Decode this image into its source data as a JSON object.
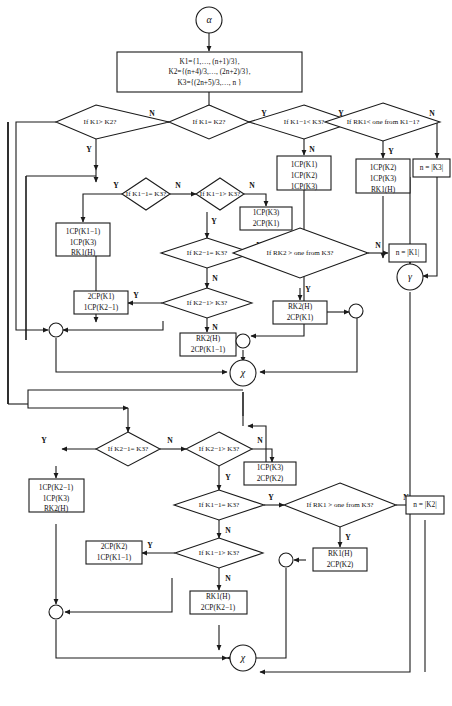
{
  "diagram": {
    "type": "flowchart",
    "title": "",
    "start_symbol": "α",
    "connector_symbols": {
      "gamma": "γ",
      "chi": "χ"
    },
    "labels": {
      "yes": "Y",
      "no": "N"
    },
    "colors": {
      "stroke": "#1a1a1a",
      "fill": "#ffffff",
      "text": "#111111"
    },
    "init_box": {
      "line1": "K1={1,…, (n+1)/3},",
      "line2": "K2={(n+4)/3,…, (2n+2)/3},",
      "line3": "K3={(2n+5)/3,…, n }"
    },
    "decisions": [
      {
        "id": "d_k1gtk2",
        "text": "If K1> K2?"
      },
      {
        "id": "d_k1eqk2",
        "text": "If K1= K2?"
      },
      {
        "id": "d_k1m1ltk3",
        "text": "If K1−1< K3?"
      },
      {
        "id": "d_rk1lt",
        "text": "If RK1< one from K1−1?"
      },
      {
        "id": "d_k1m1eqk3",
        "text": "If K1−1= K3?"
      },
      {
        "id": "d_k1m1gtk3",
        "text": "If K1−1> K3?"
      },
      {
        "id": "d_k2m1eqk3a",
        "text": "If K2−1= K3?"
      },
      {
        "id": "d_k2m1gtk3a",
        "text": "If K2−1> K3?"
      },
      {
        "id": "d_rk2gt",
        "text": "If RK2 > one from K3?"
      },
      {
        "id": "d_k2m1eqk3b",
        "text": "If K2−1= K3?"
      },
      {
        "id": "d_k2m1gtk3b",
        "text": "If K2−1> K3?"
      },
      {
        "id": "d_k1m1eqk3b",
        "text": "If K1−1= K3?"
      },
      {
        "id": "d_rk1gt",
        "text": "If RK1 > one from K3?"
      },
      {
        "id": "d_k1m1gtk3b",
        "text": "If K1−1> K3?"
      }
    ],
    "process_boxes": [
      {
        "id": "p_1cp123",
        "lines": [
          "1CP(K1)",
          "1CP(K2)",
          "1CP(K3)"
        ]
      },
      {
        "id": "p_k2k3rk1",
        "lines": [
          "1CP(K2)",
          "1CP(K3)",
          "RK1(H)"
        ]
      },
      {
        "id": "p_k1m1k3rk1",
        "lines": [
          "1CP(K1−1)",
          "1CP(K3)",
          "RK1(H)"
        ]
      },
      {
        "id": "p_1k3_2k1",
        "lines": [
          "1CP(K3)",
          "2CP(K1)"
        ]
      },
      {
        "id": "p_2k1_1k2m1",
        "lines": [
          "2CP(K1)",
          "1CP(K2−1)"
        ]
      },
      {
        "id": "p_rk2_2k1m1",
        "lines": [
          "RK2(H)",
          "2CP(K1−1)"
        ]
      },
      {
        "id": "p_rk2_2k1",
        "lines": [
          "RK2(H)",
          "2CP(K1)"
        ]
      },
      {
        "id": "p_1k3_2k2",
        "lines": [
          "1CP(K3)",
          "2CP(K2)"
        ]
      },
      {
        "id": "p_k2m1k3rk2",
        "lines": [
          "1CP(K2−1)",
          "1CP(K3)",
          "RK2(H)"
        ]
      },
      {
        "id": "p_2k2_1k1m1",
        "lines": [
          "2CP(K2)",
          "1CP(K1−1)"
        ]
      },
      {
        "id": "p_rk1_2k2",
        "lines": [
          "RK1(H)",
          "2CP(K2)"
        ]
      },
      {
        "id": "p_rk1_2k2m1",
        "lines": [
          "RK1(H)",
          "2CP(K2−1)"
        ]
      }
    ],
    "terminal_boxes": [
      {
        "id": "n_k3",
        "text": "n = |K3|"
      },
      {
        "id": "n_k1",
        "text": "n = |K1|"
      },
      {
        "id": "n_k2",
        "text": "n = |K2|"
      }
    ],
    "caption": ""
  }
}
